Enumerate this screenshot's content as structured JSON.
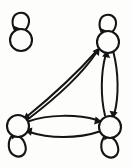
{
  "figure": {
    "background_color": "#fdfdfc",
    "stroke_color": "#141414",
    "width": 132,
    "height": 167
  },
  "graph_data": {
    "type": "directed-graph",
    "node_count": 4,
    "edge_count": 6,
    "self_loop_count": 4,
    "nodes": [
      {
        "id": "n0",
        "label": "",
        "cx": 21,
        "cy": 40,
        "r": 11,
        "name": "isolated-node",
        "self_loop": true,
        "self_loop_side": "top"
      },
      {
        "id": "n1",
        "label": "",
        "cx": 108,
        "cy": 42,
        "r": 11,
        "name": "top-right-node",
        "self_loop": true,
        "self_loop_side": "top"
      },
      {
        "id": "n2",
        "label": "",
        "cx": 18,
        "cy": 126,
        "r": 11,
        "name": "bottom-left-node",
        "self_loop": true,
        "self_loop_side": "bottom"
      },
      {
        "id": "n3",
        "label": "",
        "cx": 110,
        "cy": 127,
        "r": 11,
        "name": "bottom-right-node",
        "self_loop": true,
        "self_loop_side": "bottom"
      }
    ],
    "edges": [
      {
        "from": "n2",
        "to": "n1",
        "curve": "arc-upper",
        "name": "edge-bottomleft-to-topright"
      },
      {
        "from": "n1",
        "to": "n2",
        "curve": "arc-lower",
        "name": "edge-topright-to-bottomleft"
      },
      {
        "from": "n3",
        "to": "n1",
        "curve": "arc-left",
        "name": "edge-bottomright-to-topright"
      },
      {
        "from": "n1",
        "to": "n3",
        "curve": "arc-right",
        "name": "edge-topright-to-bottomright"
      },
      {
        "from": "n2",
        "to": "n3",
        "curve": "arc-upper",
        "name": "edge-bottomleft-to-bottomright"
      },
      {
        "from": "n3",
        "to": "n2",
        "curve": "arc-lower",
        "name": "edge-bottomright-to-bottomleft"
      }
    ],
    "self_loops": [
      {
        "node": "n0",
        "name": "self-loop-isolated"
      },
      {
        "node": "n1",
        "name": "self-loop-top-right"
      },
      {
        "node": "n2",
        "name": "self-loop-bottom-left"
      },
      {
        "node": "n3",
        "name": "self-loop-bottom-right"
      }
    ]
  }
}
